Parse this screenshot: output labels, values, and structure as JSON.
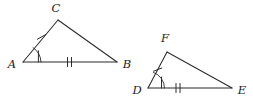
{
  "figure": {
    "caption": "Two triangles with congruence markings",
    "background_color": "#ffffff",
    "stroke_color": "#2b2b2b",
    "label_color": "#1d1d1d",
    "width": 253,
    "height": 102
  },
  "triangles": [
    {
      "id": "triangle-abc",
      "name": "ABC",
      "vertices": [
        {
          "label": "A",
          "x": 23,
          "y": 62,
          "label_x": 12,
          "label_y": 65
        },
        {
          "label": "B",
          "x": 117,
          "y": 62,
          "label_x": 127,
          "label_y": 65
        },
        {
          "label": "C",
          "x": 58,
          "y": 20,
          "label_x": 56,
          "label_y": 8
        }
      ],
      "sides": [
        {
          "name": "AB",
          "from": "A",
          "to": "B",
          "ticks": 2
        },
        {
          "name": "AC",
          "from": "A",
          "to": "C",
          "ticks": 1
        },
        {
          "name": "CB",
          "from": "C",
          "to": "B",
          "ticks": 0
        }
      ],
      "angles": [
        {
          "at": "A",
          "marks": 1
        }
      ]
    },
    {
      "id": "triangle-def",
      "name": "DEF",
      "vertices": [
        {
          "label": "D",
          "x": 148,
          "y": 88,
          "label_x": 137,
          "label_y": 91
        },
        {
          "label": "E",
          "x": 232,
          "y": 88,
          "label_x": 242,
          "label_y": 91
        },
        {
          "label": "F",
          "x": 167,
          "y": 52,
          "label_x": 165,
          "label_y": 38
        }
      ],
      "sides": [
        {
          "name": "DE",
          "from": "D",
          "to": "E",
          "ticks": 2
        },
        {
          "name": "DF",
          "from": "D",
          "to": "F",
          "ticks": 1
        },
        {
          "name": "FE",
          "from": "F",
          "to": "E",
          "ticks": 0
        }
      ],
      "angles": [
        {
          "at": "D",
          "marks": 1
        }
      ]
    }
  ]
}
